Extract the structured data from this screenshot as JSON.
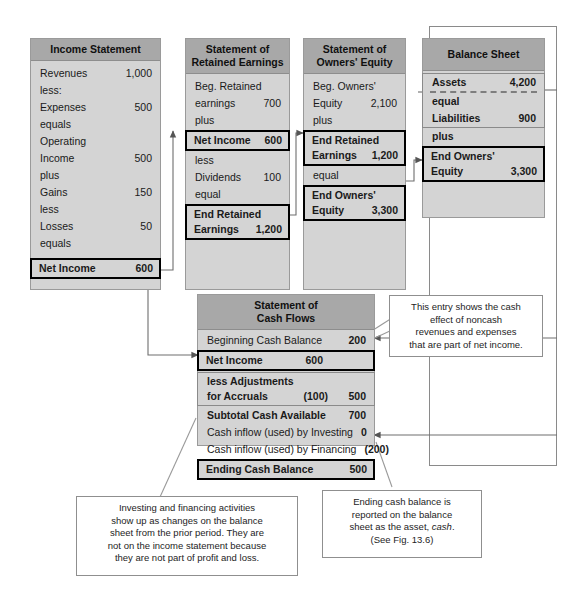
{
  "panels": {
    "income_statement": {
      "title": "Income Statement",
      "rows": [
        {
          "label": "Revenues",
          "value": "1,000",
          "style": "plain"
        },
        {
          "label": "less:",
          "value": "",
          "style": "plain"
        },
        {
          "label": "Expenses",
          "value": "500",
          "style": "plain"
        },
        {
          "label": "equals",
          "value": "",
          "style": "plain"
        },
        {
          "label": "Operating",
          "value": "",
          "style": "plain"
        },
        {
          "label": "Income",
          "value": "500",
          "style": "plain"
        },
        {
          "label": "plus",
          "value": "",
          "style": "plain"
        },
        {
          "label": "Gains",
          "value": "150",
          "style": "plain"
        },
        {
          "label": "less",
          "value": "",
          "style": "plain"
        },
        {
          "label": "Losses",
          "value": "50",
          "style": "plain"
        },
        {
          "label": "equals",
          "value": "",
          "style": "plain"
        },
        {
          "label": "Net Income",
          "value": "600",
          "style": "boxed"
        }
      ]
    },
    "retained_earnings": {
      "title_line1": "Statement of",
      "title_line2": "Retained Earnings",
      "rows": [
        {
          "label": "Beg. Retained",
          "value": "",
          "style": "plain"
        },
        {
          "label": "earnings",
          "value": "700",
          "style": "plain"
        },
        {
          "label": "plus",
          "value": "",
          "style": "plain"
        },
        {
          "label": "Net Income",
          "value": "600",
          "style": "boxed"
        },
        {
          "label": "less",
          "value": "",
          "style": "plain"
        },
        {
          "label": "Dividends",
          "value": "100",
          "style": "plain"
        },
        {
          "label": "equal",
          "value": "",
          "style": "plain"
        },
        {
          "label": "End Retained",
          "value": "",
          "style": "boxed-top"
        },
        {
          "label": "Earnings",
          "value": "1,200",
          "style": "boxed-bottom"
        }
      ]
    },
    "owners_equity": {
      "title_line1": "Statement of",
      "title_line2": "Owners' Equity",
      "rows": [
        {
          "label": "Beg. Owners'",
          "value": "",
          "style": "plain"
        },
        {
          "label": "Equity",
          "value": "2,100",
          "style": "plain"
        },
        {
          "label": "plus",
          "value": "",
          "style": "plain"
        },
        {
          "label": "End Retained",
          "value": "",
          "style": "boxed-top"
        },
        {
          "label": "Earnings",
          "value": "1,200",
          "style": "boxed-bottom"
        },
        {
          "label": "equal",
          "value": "",
          "style": "plain"
        },
        {
          "label": "End Owners'",
          "value": "",
          "style": "boxed-top"
        },
        {
          "label": "Equity",
          "value": "3,300",
          "style": "boxed-bottom"
        }
      ]
    },
    "balance_sheet": {
      "title": "Balance Sheet",
      "rows": [
        {
          "label": "Assets",
          "value": "4,200",
          "style": "grey-group-top"
        },
        {
          "label": "equal",
          "value": "",
          "style": "grey-group-mid"
        },
        {
          "label": "Liabilities",
          "value": "900",
          "style": "grey-group-bottom"
        },
        {
          "label": "plus",
          "value": "",
          "style": "plain"
        },
        {
          "label": "End Owners'",
          "value": "",
          "style": "boxed-top"
        },
        {
          "label": "Equity",
          "value": "3,300",
          "style": "boxed-bottom"
        }
      ]
    },
    "cash_flows": {
      "title_line1": "Statement of",
      "title_line2": "Cash Flows",
      "rows": [
        {
          "label": "Beginning Cash Balance",
          "value": "200",
          "value2": "",
          "style": "plain-bold-value"
        },
        {
          "label": "Net Income",
          "value": "600",
          "value2": "",
          "style": "boxed"
        },
        {
          "label": "less Adjustments",
          "value": "",
          "value2": "",
          "style": "grey-group-top"
        },
        {
          "label": "for Accruals",
          "value": "(100)",
          "value2": "500",
          "style": "grey-group-bottom"
        },
        {
          "label": "Subtotal Cash Available",
          "value": "700",
          "value2": "",
          "style": "bold"
        },
        {
          "label": "Cash inflow (used) by Investing",
          "value": "0",
          "value2": "",
          "style": "plain-bold-value"
        },
        {
          "label": "Cash inflow (used) by Financing",
          "value": "(200)",
          "value2": "",
          "style": "plain-bold-value"
        },
        {
          "label": "Ending Cash Balance",
          "value": "500",
          "value2": "",
          "style": "boxed"
        }
      ]
    }
  },
  "notes": {
    "noncash": {
      "line1": "This entry shows the cash",
      "line2": "effect of noncash",
      "line3": "revenues and expenses",
      "line4": "that are part of net income."
    },
    "investing_financing": {
      "line1": "Investing and financing activities",
      "line2": "show up as changes on the balance",
      "line3": "sheet from the prior period. They are",
      "line4": "not on the income statement because",
      "line5": "they are not part of profit and loss."
    },
    "ending_cash": {
      "line1": "Ending cash balance is",
      "line2": "reported on the balance",
      "line3": "sheet as the asset,",
      "line3_italic": "cash",
      "line3_tail": ".",
      "line4": "(See Fig. 13.6)"
    }
  },
  "colors": {
    "panel_body": "#d4d4d4",
    "panel_header": "#a8a8a8",
    "panel_border": "#9a9a9a",
    "emphasis_border": "#000000",
    "connector": "#6e6e6e",
    "note_background": "#ffffff",
    "note_border": "#8f8f8f"
  }
}
